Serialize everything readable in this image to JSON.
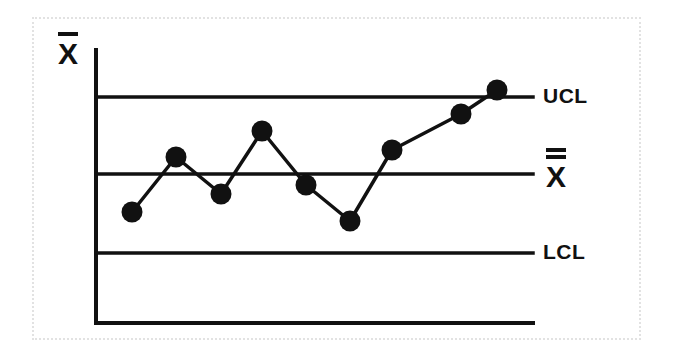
{
  "figure": {
    "kind": "control-chart",
    "background_color": "#ffffff",
    "ink_color": "#111111",
    "frame_color": "#e2e2e2"
  },
  "axes": {
    "y_axis_label": "X",
    "y_axis_label_overbars": 1,
    "x_axis_label": "",
    "y_axis_x_px": 96,
    "y_axis_top_px": 50,
    "y_axis_bottom_px": 323,
    "x_axis_right_px": 533
  },
  "limits": {
    "ucl": {
      "label": "UCL",
      "y_px": 97
    },
    "center": {
      "label": "X",
      "label_overbars": 2,
      "y_px": 174
    },
    "lcl": {
      "label": "LCL",
      "y_px": 253
    }
  },
  "chart_data": {
    "type": "line",
    "title": "",
    "subtitle": "",
    "xlabel": "",
    "ylabel": "X̄",
    "grid": false,
    "legend_position": "right",
    "marker": "filled-circle",
    "marker_radius_px": 10,
    "x": [
      1,
      2,
      3,
      4,
      5,
      6,
      7,
      8,
      9
    ],
    "categories": [
      "1",
      "2",
      "3",
      "4",
      "5",
      "6",
      "7",
      "8",
      "9"
    ],
    "series": [
      {
        "name": "Subgroup mean",
        "values": [
          -0.5,
          0.22,
          -0.26,
          0.56,
          -0.14,
          -0.61,
          0.31,
          0.78,
          1.09
        ],
        "points_px": [
          {
            "x": 132,
            "y": 212
          },
          {
            "x": 176,
            "y": 157
          },
          {
            "x": 221,
            "y": 194
          },
          {
            "x": 262,
            "y": 131
          },
          {
            "x": 306,
            "y": 185
          },
          {
            "x": 350,
            "y": 221
          },
          {
            "x": 392,
            "y": 150
          },
          {
            "x": 461,
            "y": 114
          },
          {
            "x": 497,
            "y": 90
          }
        ]
      }
    ],
    "reference_lines": [
      {
        "name": "UCL",
        "label": "UCL",
        "value": 1.0,
        "y_px": 97
      },
      {
        "name": "CL",
        "label": "X̿",
        "value": 0.0,
        "y_px": 174
      },
      {
        "name": "LCL",
        "label": "LCL",
        "value": -1.0,
        "y_px": 253
      }
    ],
    "ylim": [
      -1.9,
      1.35
    ],
    "annotations": [
      "Last point falls on the upper control limit",
      "Trend of increasing values across final four subgroups"
    ]
  }
}
